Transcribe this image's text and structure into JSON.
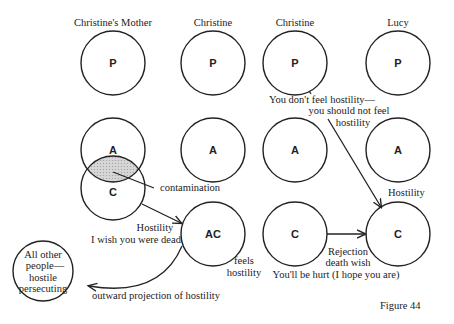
{
  "columns": [
    {
      "title": "Christine's Mother"
    },
    {
      "title": "Christine"
    },
    {
      "title": "Christine"
    },
    {
      "title": "Lucy"
    }
  ],
  "ego_states": {
    "mother": {
      "p": "P",
      "a": "A",
      "c": "C"
    },
    "christine1": {
      "p": "P",
      "a": "A",
      "ac": "AC"
    },
    "christine2": {
      "p": "P",
      "a": "A",
      "c": "C"
    },
    "lucy": {
      "p": "P",
      "a": "A",
      "c": "C"
    }
  },
  "others_circle": {
    "lines": [
      "All other",
      "people—",
      "hostile",
      "persecuting"
    ]
  },
  "labels": {
    "contamination": "contamination",
    "hostility_1": "Hostility",
    "wish_dead": "I wish you were dead",
    "feels_1": "feels",
    "feels_2": "hostility",
    "outward": "outward projection of hostility",
    "dont_feel_1": "You don't feel hostility—",
    "dont_feel_2": "you should not feel",
    "dont_feel_3": "hostility",
    "hostility_2": "Hostility",
    "rejection": "Rejection",
    "death_wish": "death wish",
    "hope_hurt": "You'll be hurt (I hope you are)"
  },
  "caption": "Figure 44"
}
